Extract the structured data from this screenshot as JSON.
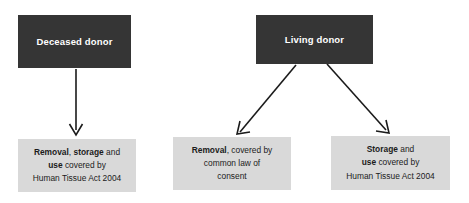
{
  "diagram": {
    "colors": {
      "source_box_fill": "#353535",
      "source_box_text": "#ffffff",
      "outcome_box_fill": "#d9d9d9",
      "outcome_box_text": "#1b1b1b",
      "arrow_stroke": "#1b1b1b",
      "background": "#ffffff"
    },
    "sources": [
      {
        "id": "deceased-donor",
        "label": "Deceased donor"
      },
      {
        "id": "living-donor",
        "label": "Living donor"
      }
    ],
    "outcomes": [
      {
        "id": "outcome-deceased",
        "plain_text": "Removal, storage and use covered by Human Tissue Act 2004",
        "lines": [
          [
            {
              "text": "Removal",
              "bold": true
            },
            {
              "text": ", ",
              "bold": false
            },
            {
              "text": "storage",
              "bold": true
            },
            {
              "text": " and",
              "bold": false
            }
          ],
          [
            {
              "text": "use",
              "bold": true
            },
            {
              "text": " covered by",
              "bold": false
            }
          ],
          [
            {
              "text": "Human Tissue Act 2004",
              "bold": false
            }
          ]
        ]
      },
      {
        "id": "outcome-removal",
        "plain_text": "Removal, covered by common law of consent",
        "lines": [
          [
            {
              "text": "Removal",
              "bold": true
            },
            {
              "text": ", covered by",
              "bold": false
            }
          ],
          [
            {
              "text": "common law of",
              "bold": false
            }
          ],
          [
            {
              "text": "consent",
              "bold": false
            }
          ]
        ]
      },
      {
        "id": "outcome-storage",
        "plain_text": "Storage and use covered by Human Tissue Act 2004",
        "lines": [
          [
            {
              "text": "Storage",
              "bold": true
            },
            {
              "text": " and",
              "bold": false
            }
          ],
          [
            {
              "text": "use",
              "bold": true
            },
            {
              "text": " covered by",
              "bold": false
            }
          ],
          [
            {
              "text": "Human Tissue Act 2004",
              "bold": false
            }
          ]
        ]
      }
    ],
    "connectors": [
      {
        "id": "arrow-deceased-to-outcome",
        "from": "deceased-donor",
        "to": "outcome-deceased",
        "shape": "vertical"
      },
      {
        "id": "arrow-living-to-removal",
        "from": "living-donor",
        "to": "outcome-removal",
        "shape": "diagonal-left"
      },
      {
        "id": "arrow-living-to-storage",
        "from": "living-donor",
        "to": "outcome-storage",
        "shape": "diagonal-right"
      }
    ]
  }
}
